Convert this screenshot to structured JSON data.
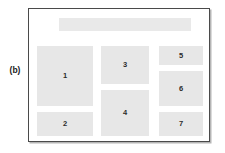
{
  "figure": {
    "panel_label": "(b)",
    "colors": {
      "block_fill": "#e7e7e7",
      "frame_border": "#4a4a4a",
      "page_background": "#ffffff",
      "label_text": "#2b2b2b"
    }
  },
  "page": {
    "regions": [
      {
        "name": "header-band",
        "label": "",
        "left": 30,
        "top": 9,
        "width": 132,
        "height": 13
      },
      {
        "name": "region-1",
        "label": "1",
        "left": 8,
        "top": 37,
        "width": 56,
        "height": 60
      },
      {
        "name": "region-2",
        "label": "2",
        "left": 8,
        "top": 103,
        "width": 56,
        "height": 24
      },
      {
        "name": "region-3",
        "label": "3",
        "left": 72,
        "top": 37,
        "width": 48,
        "height": 38
      },
      {
        "name": "region-4",
        "label": "4",
        "left": 72,
        "top": 81,
        "width": 48,
        "height": 46
      },
      {
        "name": "region-5",
        "label": "5",
        "left": 130,
        "top": 37,
        "width": 44,
        "height": 19
      },
      {
        "name": "region-6",
        "label": "6",
        "left": 130,
        "top": 62,
        "width": 44,
        "height": 35
      },
      {
        "name": "region-7",
        "label": "7",
        "left": 130,
        "top": 103,
        "width": 44,
        "height": 24
      }
    ]
  }
}
